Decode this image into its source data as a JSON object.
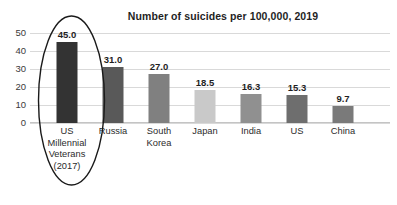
{
  "chart_data": {
    "type": "bar",
    "title": "Number of suicides per 100,000, 2019",
    "xlabel": "",
    "ylabel": "",
    "ylim": [
      0,
      50
    ],
    "yticks": [
      0,
      10,
      20,
      30,
      40,
      50
    ],
    "ytick_labels": [
      "0",
      "10",
      "20",
      "30",
      "40",
      "50"
    ],
    "grid": true,
    "legend": "none",
    "categories": [
      "US Millennial Veterans (2017)",
      "Russia",
      "South Korea",
      "Japan",
      "India",
      "US",
      "China"
    ],
    "category_lines": [
      [
        "US",
        "Millennial",
        "Veterans",
        "(2017)"
      ],
      [
        "Russia"
      ],
      [
        "South",
        "Korea"
      ],
      [
        "Japan"
      ],
      [
        "India"
      ],
      [
        "US"
      ],
      [
        "China"
      ]
    ],
    "values": [
      45.0,
      31.0,
      27.0,
      18.5,
      16.3,
      15.3,
      9.7
    ],
    "value_labels": [
      "45.0",
      "31.0",
      "27.0",
      "18.5",
      "16.3",
      "15.3",
      "9.7"
    ],
    "bar_colors": [
      "#333333",
      "#595959",
      "#808080",
      "#c9c9c9",
      "#909090",
      "#6e6e6e",
      "#7a7a7a"
    ],
    "annotations": [
      {
        "type": "ellipse",
        "label": "highlight-ellipse-us-millennial-veterans",
        "target": "US Millennial Veterans (2017)",
        "color": "#1a1a1a"
      }
    ]
  },
  "style": {
    "gridline_color": "#d9d9d9",
    "baseline_color": "#c4c4c4",
    "text_color": "#1f1f1f",
    "background": "#ffffff"
  }
}
